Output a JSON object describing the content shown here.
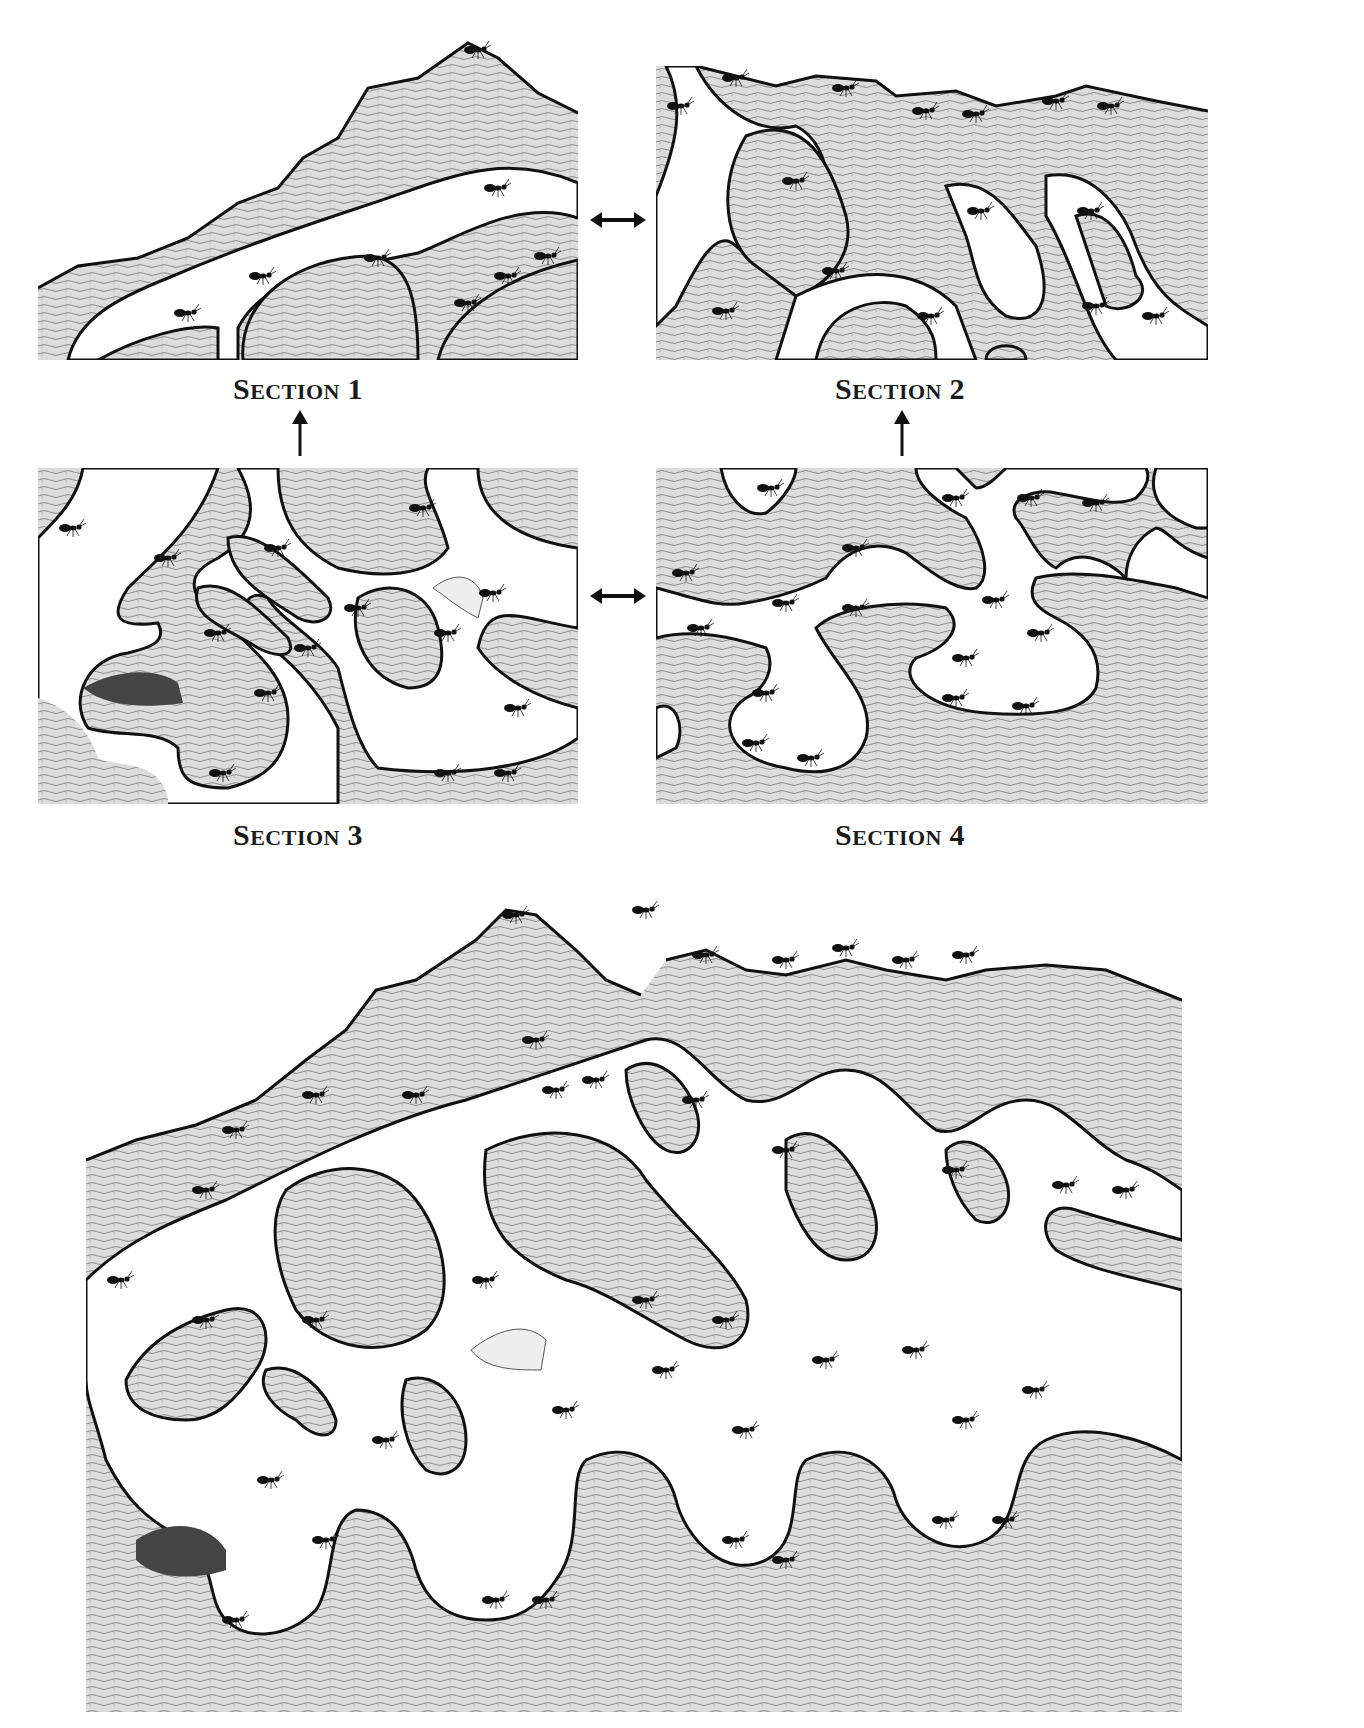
{
  "figure": {
    "sections": [
      {
        "id": 1,
        "label": "Section 1",
        "first": "S",
        "rest": "ection",
        "num": "1"
      },
      {
        "id": 2,
        "label": "Section 2",
        "first": "S",
        "rest": "ection",
        "num": "2"
      },
      {
        "id": 3,
        "label": "Section 3",
        "first": "S",
        "rest": "ection",
        "num": "3"
      },
      {
        "id": 4,
        "label": "Section 4",
        "first": "S",
        "rest": "ection",
        "num": "4"
      }
    ],
    "connectors": [
      {
        "from": 1,
        "to": 2,
        "type": "double-arrow-horizontal"
      },
      {
        "from": 3,
        "to": 4,
        "type": "double-arrow-horizontal"
      },
      {
        "from": 3,
        "to": 1,
        "type": "arrow-up"
      },
      {
        "from": 4,
        "to": 2,
        "type": "arrow-up"
      }
    ],
    "composite": {
      "description": "Combined nest assembled from sections 1-4"
    },
    "colors": {
      "soil": "#d4d4d4",
      "soil_line": "#9a9a9a",
      "outline": "#111111",
      "tunnel": "#ffffff",
      "ant": "#111111"
    }
  }
}
